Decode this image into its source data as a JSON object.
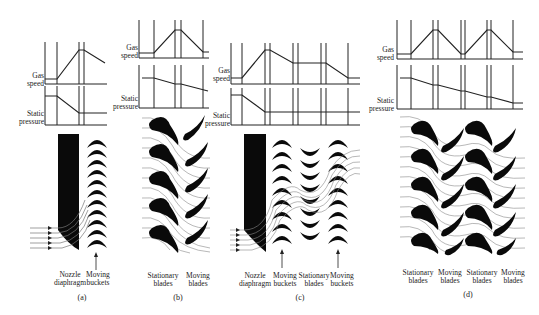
{
  "figure": {
    "panels": [
      {
        "id": "a",
        "caption": "(a)",
        "graph_labels": {
          "gas_speed": "Gas speed",
          "static_pressure": "Static pressure"
        },
        "stage_labels": [
          "Nozzle diaphragm",
          "Moving buckets"
        ]
      },
      {
        "id": "b",
        "caption": "(b)",
        "graph_labels": {
          "gas_speed": "Gas speed",
          "static_pressure": "Static pressure"
        },
        "stage_labels": [
          "Stationary blades",
          "Moving blades"
        ]
      },
      {
        "id": "c",
        "caption": "(c)",
        "graph_labels": {
          "gas_speed": "Gas speed",
          "static_pressure": "Static pressure"
        },
        "stage_labels": [
          "Nozzle diaphragm",
          "Moving buckets",
          "Stationary blades",
          "Moving buckets"
        ]
      },
      {
        "id": "d",
        "caption": "(d)",
        "graph_labels": {
          "gas_speed": "Gas speed",
          "static_pressure": "Static pressure"
        },
        "stage_labels": [
          "Stationary blades",
          "Moving blades",
          "Stationary blades",
          "Moving blades"
        ]
      }
    ]
  }
}
